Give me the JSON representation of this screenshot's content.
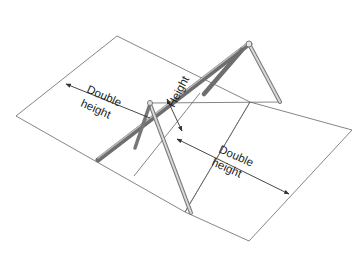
{
  "diagram": {
    "labels": {
      "left_zone_line1": "Double",
      "left_zone_line2": "height",
      "height_label": "Height",
      "right_zone_line1": "Double",
      "right_zone_line2": "height"
    },
    "colors": {
      "background": "#ffffff",
      "outline": "#555555",
      "frame_light": "#d4d4d4",
      "frame_dark": "#6e6e6e",
      "text": "#222222"
    }
  }
}
